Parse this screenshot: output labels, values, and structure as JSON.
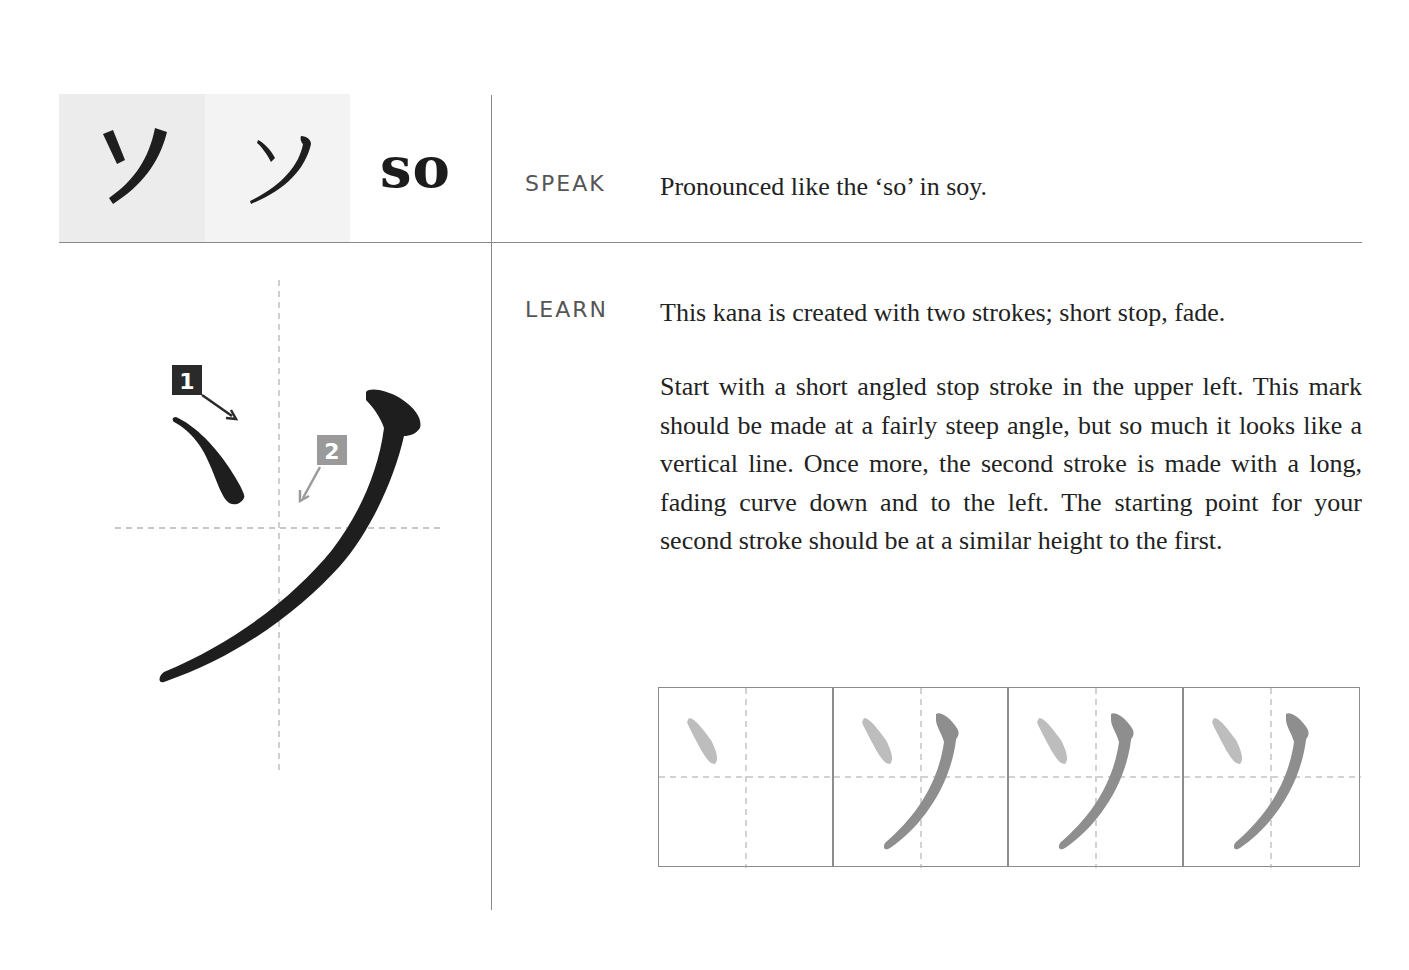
{
  "header": {
    "typeset_glyph": "ソ",
    "handwritten_glyph": "ソ",
    "romaji": "so"
  },
  "speak": {
    "label": "SPEAK",
    "text": "Pronounced like the ‘so’ in soy."
  },
  "learn": {
    "label": "LEARN",
    "summary": "This kana is created with two strokes; short stop, fade.",
    "detail": "Start with a short angled stop stroke in the upper left. This mark should be made at a fairly steep angle, but so much it looks like a vertical line. Once more, the second stroke is made with a long, fading curve down and to the left. The starting point for your second stroke should be at a similar height to the first."
  },
  "stroke_diagram": {
    "strokes": [
      {
        "number": "1",
        "badge_color": "#2a2a2a",
        "type": "short stop"
      },
      {
        "number": "2",
        "badge_color": "#9a9a9a",
        "type": "fade"
      }
    ],
    "ink_color": "#1e1e1e",
    "guide_color": "#b5b5b5"
  },
  "practice_grid": {
    "cells": [
      {
        "strokes_shown": 1
      },
      {
        "strokes_shown": 2
      },
      {
        "strokes_shown": 2
      },
      {
        "strokes_shown": 2
      }
    ],
    "stroke1_color": "#bdbdbd",
    "stroke2_color": "#8e8e8e"
  }
}
